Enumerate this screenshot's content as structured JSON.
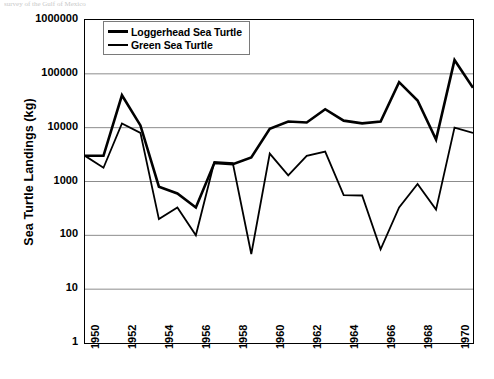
{
  "top_caption": "survey of the Gulf of Mexico",
  "chart_data": {
    "type": "line",
    "title": "",
    "xlabel": "",
    "ylabel": "Sea Turtle Landings (kg)",
    "yscale": "log",
    "ylim": [
      1,
      1000000
    ],
    "ytick_labels": [
      "1000000",
      "100000",
      "10000",
      "1000",
      "100",
      "10",
      "1"
    ],
    "ytick_values": [
      1000000,
      100000,
      10000,
      1000,
      100,
      10,
      1
    ],
    "xlim": [
      1950,
      1971
    ],
    "xtick_labels": [
      "1950",
      "1952",
      "1954",
      "1956",
      "1958",
      "1960",
      "1962",
      "1964",
      "1966",
      "1968",
      "1970"
    ],
    "xtick_values": [
      1950,
      1952,
      1954,
      1956,
      1958,
      1960,
      1962,
      1964,
      1966,
      1968,
      1970
    ],
    "grid": "horizontal",
    "legend_position": "top-left",
    "x": [
      1950,
      1951,
      1952,
      1953,
      1954,
      1955,
      1956,
      1957,
      1958,
      1959,
      1960,
      1961,
      1962,
      1963,
      1964,
      1965,
      1966,
      1967,
      1968,
      1969,
      1970,
      1971
    ],
    "series": [
      {
        "name": "Loggerhead Sea Turtle",
        "color": "#000000",
        "line_width": 2.6,
        "values": [
          3000,
          3000,
          40000,
          11000,
          800,
          600,
          330,
          2200,
          2100,
          2800,
          9500,
          13000,
          12500,
          22000,
          13500,
          12000,
          13000,
          70000,
          32000,
          6000,
          180000,
          55000
        ]
      },
      {
        "name": "Green Sea Turtle",
        "color": "#000000",
        "line_width": 1.8,
        "values": [
          3000,
          1800,
          12000,
          8000,
          200,
          330,
          100,
          2300,
          2200,
          45,
          3300,
          1300,
          3000,
          3600,
          560,
          550,
          55,
          330,
          900,
          300,
          10000,
          8000
        ]
      }
    ]
  },
  "legend": {
    "items": [
      {
        "label": "Loggerhead Sea Turtle",
        "style": "thick"
      },
      {
        "label": "Green Sea Turtle",
        "style": "thin"
      }
    ]
  }
}
